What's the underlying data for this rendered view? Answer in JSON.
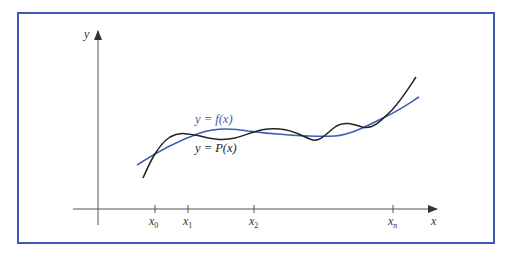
{
  "figure": {
    "frame_color": "#3b5bb5",
    "axes": {
      "x_label": "x",
      "y_label": "y",
      "axis_color": "#333333"
    },
    "ticks": [
      {
        "label": "x",
        "sub": "0",
        "x": 155
      },
      {
        "label": "x",
        "sub": "1",
        "x": 188
      },
      {
        "label": "x",
        "sub": "2",
        "x": 254
      },
      {
        "label": "x",
        "sub": "n",
        "x": 393
      }
    ],
    "curves": {
      "f": {
        "label": "y = f(x)",
        "color": "#3b5bb5"
      },
      "P": {
        "label": "y = P(x)",
        "color": "#222222"
      }
    }
  }
}
